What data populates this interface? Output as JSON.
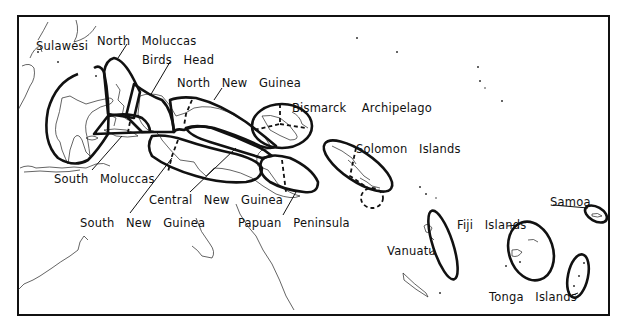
{
  "map": {
    "frame": {
      "x": 18,
      "y": 16,
      "width": 591,
      "height": 299
    },
    "line_color": "#111111",
    "background": "#ffffff",
    "regions": [
      {
        "id": "sulawesi",
        "label": "Sulawesi",
        "label_pos": [
          36,
          21
        ]
      },
      {
        "id": "north-moluccas",
        "label": "North   Moluccas",
        "label_pos": [
          97,
          37
        ]
      },
      {
        "id": "birds-head",
        "label": "Birds   Head",
        "label_pos": [
          142,
          56
        ]
      },
      {
        "id": "north-new-guinea",
        "label": "North   New   Guinea",
        "label_pos": [
          177,
          79
        ]
      },
      {
        "id": "bismarck-archipelago",
        "label": "Bismarck    Archipelago",
        "label_pos": [
          292,
          103
        ]
      },
      {
        "id": "solomon-islands",
        "label": "Solomon   Islands",
        "label_pos": [
          356,
          144
        ]
      },
      {
        "id": "south-moluccas",
        "label": "South   Moluccas",
        "label_pos": [
          54,
          174
        ]
      },
      {
        "id": "central-new-guinea",
        "label": "Central   New   Guinea",
        "label_pos": [
          149,
          195
        ]
      },
      {
        "id": "south-new-guinea",
        "label": "South   New   Guinea",
        "label_pos": [
          80,
          218
        ]
      },
      {
        "id": "papuan-peninsula",
        "label": "Papuan   Peninsula",
        "label_pos": [
          238,
          218
        ]
      },
      {
        "id": "vanuatu",
        "label": "Vanuatu",
        "label_pos": [
          387,
          246
        ]
      },
      {
        "id": "fiji-islands",
        "label": "Fiji   Islands",
        "label_pos": [
          457,
          225
        ]
      },
      {
        "id": "samoa",
        "label": "Samoa",
        "label_pos": [
          550,
          197
        ]
      },
      {
        "id": "tonga-islands",
        "label": "Tonga   Islands",
        "label_pos": [
          490,
          293
        ]
      }
    ]
  }
}
